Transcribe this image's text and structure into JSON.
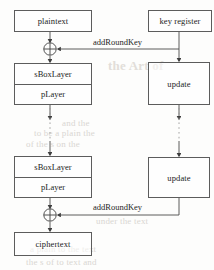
{
  "diagram": {
    "colors": {
      "stroke": "#5c5c5c",
      "line": "#4a4a4a",
      "text": "#232323",
      "background": "#fdfdfc",
      "ghost": "#d9d6d2"
    },
    "nodes": {
      "plaintext": {
        "label": "plaintext"
      },
      "key_register": {
        "label": "key register"
      },
      "sbox_top": {
        "label": "sBoxLayer"
      },
      "player_top": {
        "label": "pLayer"
      },
      "update_top": {
        "label": "update"
      },
      "sbox_bottom": {
        "label": "sBoxLayer"
      },
      "player_bottom": {
        "label": "pLayer"
      },
      "update_bottom": {
        "label": "update"
      },
      "ciphertext": {
        "label": "ciphertext"
      }
    },
    "edge_labels": {
      "add_round_key_top": "addRoundKey",
      "add_round_key_bottom": "addRoundKey"
    },
    "operators": {
      "xor_top": "⊕",
      "xor_bottom": "⊕"
    },
    "ghost_artifacts": [
      {
        "text": "the Art of",
        "x": 120,
        "y": 64
      },
      {
        "text": "and the",
        "x": 70,
        "y": 120
      },
      {
        "text": "to be a plain the",
        "x": 40,
        "y": 126
      },
      {
        "text": "of the s on the",
        "x": 30,
        "y": 139
      },
      {
        "text": "under the text",
        "x": 98,
        "y": 214
      },
      {
        "text": "a plain to the text",
        "x": 34,
        "y": 245
      },
      {
        "text": "the s of to text and",
        "x": 30,
        "y": 258
      }
    ]
  }
}
